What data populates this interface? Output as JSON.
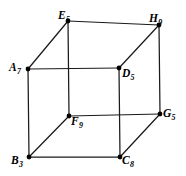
{
  "figure": {
    "kind": "cube-graph-diagram",
    "width": 186,
    "height": 176,
    "background_color": "#ffffff",
    "line_color": "#1a1a1a",
    "vertex_color": "#000000",
    "vertices": [
      {
        "id": "E",
        "label_letter": "E",
        "label_subscript": "5",
        "x": 68,
        "y": 21,
        "face": "back"
      },
      {
        "id": "H",
        "label_letter": "H",
        "label_subscript": "9",
        "x": 159,
        "y": 25,
        "face": "back"
      },
      {
        "id": "A",
        "label_letter": "A",
        "label_subscript": "7",
        "x": 28,
        "y": 69,
        "face": "front"
      },
      {
        "id": "D",
        "label_letter": "D",
        "label_subscript": "5",
        "x": 119,
        "y": 68,
        "face": "front"
      },
      {
        "id": "F",
        "label_letter": "F",
        "label_subscript": "9",
        "x": 69,
        "y": 116,
        "face": "back"
      },
      {
        "id": "G",
        "label_letter": "G",
        "label_subscript": "5",
        "x": 160,
        "y": 114,
        "face": "back"
      },
      {
        "id": "B",
        "label_letter": "B",
        "label_subscript": "3",
        "x": 29,
        "y": 157,
        "face": "front"
      },
      {
        "id": "C",
        "label_letter": "C",
        "label_subscript": "8",
        "x": 120,
        "y": 157,
        "face": "front"
      }
    ],
    "edges": [
      {
        "from": "A",
        "to": "D"
      },
      {
        "from": "D",
        "to": "C"
      },
      {
        "from": "C",
        "to": "B"
      },
      {
        "from": "B",
        "to": "A"
      },
      {
        "from": "E",
        "to": "H"
      },
      {
        "from": "H",
        "to": "G"
      },
      {
        "from": "G",
        "to": "F"
      },
      {
        "from": "F",
        "to": "E"
      },
      {
        "from": "A",
        "to": "E"
      },
      {
        "from": "D",
        "to": "H"
      },
      {
        "from": "B",
        "to": "F"
      },
      {
        "from": "C",
        "to": "G"
      }
    ]
  }
}
